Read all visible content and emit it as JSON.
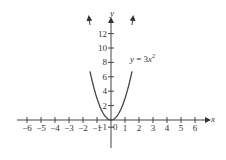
{
  "chart_data": {
    "type": "line",
    "title": "",
    "equation_label": "y = 3x²",
    "xlabel": "x",
    "ylabel": "y",
    "x_ticks": [
      -6,
      -5,
      -4,
      -3,
      -2,
      -1,
      0,
      1,
      2,
      3,
      4,
      5,
      6
    ],
    "y_ticks": [
      -1,
      2,
      4,
      6,
      8,
      10,
      12
    ],
    "xlim": [
      -6.5,
      7
    ],
    "ylim": [
      -3,
      15
    ],
    "grid": false,
    "series": [
      {
        "name": "y = 3x²",
        "function": "3*x^2",
        "x": [
          -2.2,
          -2,
          -1.5,
          -1,
          -0.5,
          0,
          0.5,
          1,
          1.5,
          2,
          2.2
        ],
        "y": [
          14.52,
          12,
          6.75,
          3,
          0.75,
          0,
          0.75,
          3,
          6.75,
          12,
          14.52
        ]
      }
    ]
  },
  "labels": {
    "x_axis": "x",
    "y_axis": "y",
    "origin": "0",
    "eq_y": "y",
    "eq_mid": " = 3",
    "eq_x": "x",
    "eq_exp": "2"
  }
}
